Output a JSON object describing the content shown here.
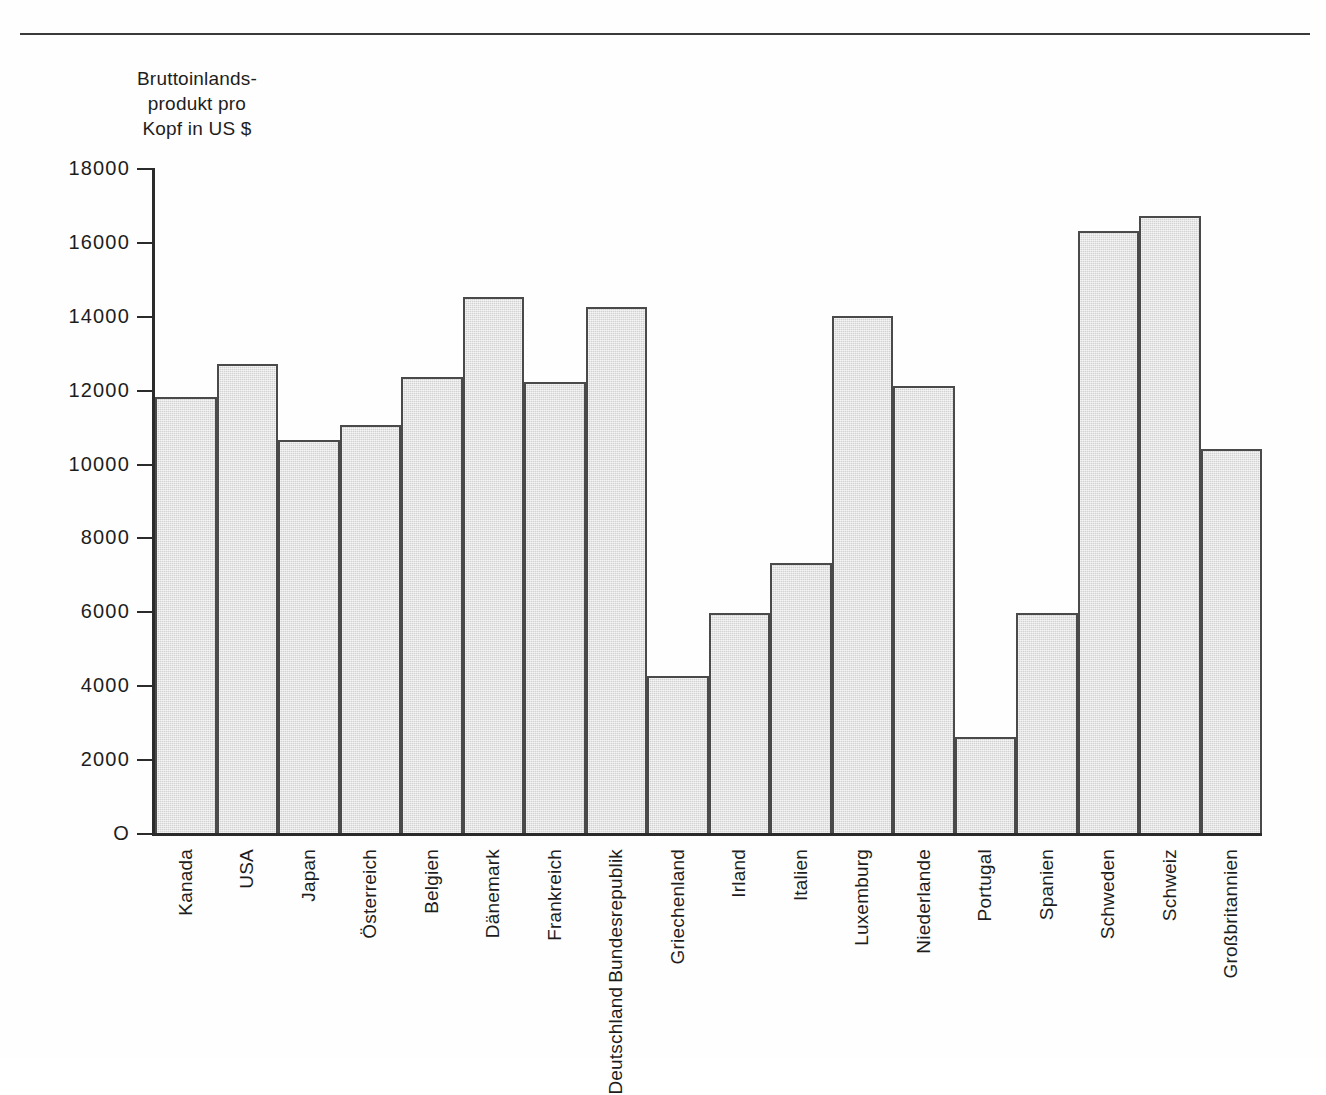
{
  "figure": {
    "axis_title": "Bruttoinlands-\nprodukt pro\nKopf in US $",
    "bar_fill_color": "#d2d2d2",
    "bar_border_color": "#4a4a4a",
    "axis_color": "#2b2b2b"
  },
  "chart_data": {
    "type": "bar",
    "title": "",
    "xlabel": "",
    "ylabel": "Bruttoinlandsprodukt pro Kopf in US $",
    "ylim": [
      0,
      18000
    ],
    "ytick_labels": [
      "O",
      "2000",
      "4000",
      "6000",
      "8000",
      "10000",
      "12000",
      "14000",
      "16000",
      "18000"
    ],
    "yticks": [
      0,
      2000,
      4000,
      6000,
      8000,
      10000,
      12000,
      14000,
      16000,
      18000
    ],
    "grid": false,
    "legend": "none",
    "categories": [
      "Kanada",
      "USA",
      "Japan",
      "Österreich",
      "Belgien",
      "Dänemark",
      "Frankreich",
      "Bundesrepublik Deutschland",
      "Griechenland",
      "Irland",
      "Italien",
      "Luxemburg",
      "Niederlande",
      "Portugal",
      "Spanien",
      "Schweden",
      "Schweiz",
      "Großbritannien"
    ],
    "category_lines": [
      [
        "Kanada"
      ],
      [
        "USA"
      ],
      [
        "Japan"
      ],
      [
        "Österreich"
      ],
      [
        "Belgien"
      ],
      [
        "Dänemark"
      ],
      [
        "Frankreich"
      ],
      [
        "Bundesrepublik",
        "Deutschland"
      ],
      [
        "Griechenland"
      ],
      [
        "Irland"
      ],
      [
        "Italien"
      ],
      [
        "Luxemburg"
      ],
      [
        "Niederlande"
      ],
      [
        "Portugal"
      ],
      [
        "Spanien"
      ],
      [
        "Schweden"
      ],
      [
        "Schweiz"
      ],
      [
        "Großbritannien"
      ]
    ],
    "values": [
      11800,
      12700,
      10650,
      11050,
      12350,
      14500,
      12200,
      14250,
      4250,
      5950,
      7300,
      14000,
      12100,
      2600,
      5950,
      16300,
      16700,
      10400
    ]
  }
}
